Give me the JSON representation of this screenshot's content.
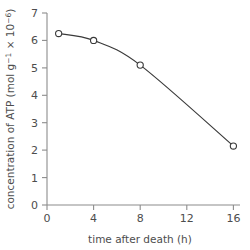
{
  "chart_data": {
    "type": "line",
    "title": "",
    "subtitle": "",
    "xlabel": "time after death (h)",
    "ylabel": "concentration of ATP (mol g⁻¹ × 10⁻⁶)",
    "ylabel_parts": {
      "main": "concentration of ATP (mol g",
      "sup1": "−1",
      "mid": " × 10",
      "sup2": "−6",
      "end": ")"
    },
    "x": [
      1,
      4,
      8,
      16
    ],
    "values": [
      6.25,
      6.0,
      5.1,
      2.15
    ],
    "series": [
      {
        "name": "ATP concentration",
        "x": [
          1,
          4,
          8,
          16
        ],
        "values": [
          6.25,
          6.0,
          5.1,
          2.15
        ]
      }
    ],
    "xlim": [
      0,
      16.6
    ],
    "ylim": [
      0,
      7.1
    ],
    "xticks": [
      0,
      4,
      8,
      12,
      16
    ],
    "xtick_labels": [
      "0",
      "4",
      "8",
      "12",
      "16"
    ],
    "yticks": [
      0,
      1,
      2,
      3,
      4,
      5,
      6,
      7
    ],
    "ytick_labels": [
      "0",
      "1",
      "2",
      "3",
      "4",
      "5",
      "6",
      "7"
    ],
    "grid": false,
    "legend": false,
    "legend_position": "none",
    "marker": "open-circle",
    "line_color": "#3a3a3a",
    "marker_fill": "#ffffff",
    "axis_color": "#8c8c8c",
    "text_color": "#4d4d4d",
    "background_color": "#ffffff"
  }
}
